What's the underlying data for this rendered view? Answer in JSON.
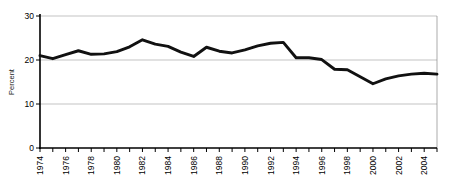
{
  "chart_data": {
    "type": "line",
    "title": "",
    "xlabel": "",
    "ylabel": "Percent",
    "ylim": [
      0,
      30
    ],
    "yticks": [
      0,
      10,
      20,
      30
    ],
    "ytick_labels": [
      "0",
      "10",
      "20",
      "30"
    ],
    "grid": true,
    "grid_axis": "y",
    "legend": "none",
    "xlim": [
      1974,
      2005
    ],
    "x": [
      1974,
      1975,
      1976,
      1977,
      1978,
      1979,
      1980,
      1981,
      1982,
      1983,
      1984,
      1985,
      1986,
      1987,
      1988,
      1989,
      1990,
      1991,
      1992,
      1993,
      1994,
      1995,
      1996,
      1997,
      1998,
      1999,
      2000,
      2001,
      2002,
      2003,
      2004,
      2005
    ],
    "xtick_labels": [
      "1974",
      "",
      "1976",
      "",
      "1978",
      "",
      "1980",
      "",
      "1982",
      "",
      "1984",
      "",
      "1986",
      "",
      "1988",
      "",
      "1990",
      "",
      "1992",
      "",
      "1994",
      "",
      "1996",
      "",
      "1998",
      "",
      "2000",
      "",
      "2002",
      "",
      "2004",
      ""
    ],
    "xtick_labels_shown": [
      "1974",
      "1976",
      "1978",
      "1980",
      "1982",
      "1984",
      "1986",
      "1988",
      "1990",
      "1992",
      "1994",
      "1996",
      "1998",
      "2000",
      "2002",
      "2004"
    ],
    "series": [
      {
        "name": "Percent",
        "color": "#111111",
        "values": [
          21.0,
          20.3,
          21.2,
          22.1,
          21.3,
          21.4,
          21.9,
          23.0,
          24.6,
          23.6,
          23.1,
          21.8,
          20.8,
          22.9,
          22.0,
          21.6,
          22.3,
          23.2,
          23.8,
          24.0,
          20.5,
          20.5,
          20.1,
          17.9,
          17.8,
          16.2,
          14.6,
          15.7,
          16.4,
          16.8,
          17.0,
          16.8
        ]
      }
    ]
  },
  "axes": {
    "y_axis_title": "Percent",
    "y_tick_0": "0",
    "y_tick_10": "10",
    "y_tick_20": "20",
    "y_tick_30": "30"
  }
}
